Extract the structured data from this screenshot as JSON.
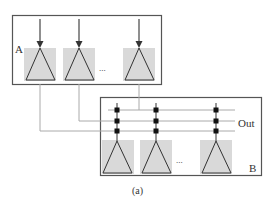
{
  "diagram": {
    "block_a": {
      "label": "A"
    },
    "block_b": {
      "label": "B",
      "output_label": "Out"
    },
    "ellipsis": "...",
    "caption": "(a)",
    "colors": {
      "border": "#555555",
      "fill": "#d9d9d9",
      "wire": "#aaaaaa",
      "arrow": "#333333",
      "node": "#111111"
    }
  }
}
